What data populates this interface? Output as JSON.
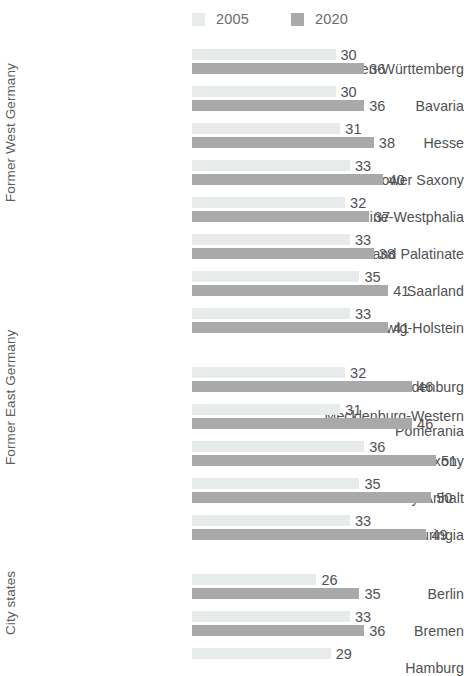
{
  "legend": {
    "items": [
      {
        "label": "2005",
        "color": "#e7ebec",
        "swatch_name": "legend-swatch-2005"
      },
      {
        "label": "2020",
        "color": "#a9a9a9",
        "swatch_name": "legend-swatch-2020"
      }
    ]
  },
  "chart_data": {
    "type": "bar",
    "orientation": "horizontal",
    "title": "",
    "subtitle": "",
    "xlabel": "",
    "ylabel": "",
    "xlim": [
      0,
      51
    ],
    "grid": false,
    "legend_position": "top",
    "series": [
      {
        "name": "2005",
        "color": "#e7ebec"
      },
      {
        "name": "2020",
        "color": "#a9a9a9"
      }
    ],
    "groups": [
      {
        "label": "Former West Germany",
        "categories": [
          "Baden-Württemberg",
          "Bavaria",
          "Hesse",
          "Lower Saxony",
          "North Rhine-Westphalia",
          "Rhineland Palatinate",
          "Saarland",
          "Schleswig-Holstein"
        ],
        "values_2005": [
          30,
          30,
          31,
          33,
          32,
          33,
          35,
          33
        ],
        "values_2020": [
          36,
          36,
          38,
          40,
          37,
          38,
          41,
          41
        ]
      },
      {
        "label": "Former East Germany",
        "categories": [
          "Brandenburg",
          "Mecklenburg-Western\nPomerania",
          "Saxony",
          "Saxony-Anhalt",
          "Thuringia"
        ],
        "values_2005": [
          32,
          31,
          36,
          35,
          33
        ],
        "values_2020": [
          46,
          46,
          51,
          50,
          49
        ]
      },
      {
        "label": "City states",
        "categories": [
          "Berlin",
          "Bremen",
          "Hamburg"
        ],
        "values_2005": [
          26,
          33,
          29
        ],
        "values_2020": [
          35,
          36,
          null
        ]
      }
    ]
  }
}
